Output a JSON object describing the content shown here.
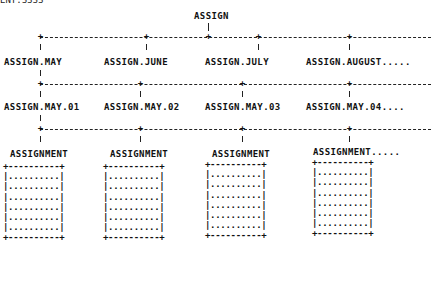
{
  "header_clip": "ENT.SSSS",
  "root": {
    "label": "ASSIGN"
  },
  "level1": [
    {
      "label": "ASSIGN.MAY"
    },
    {
      "label": "ASSIGN.JUNE"
    },
    {
      "label": "ASSIGN.JULY"
    },
    {
      "label": "ASSIGN.AUGUST....."
    }
  ],
  "level2": [
    {
      "label": "ASSIGN.MAY.01"
    },
    {
      "label": "ASSIGN.MAY.02"
    },
    {
      "label": "ASSIGN.MAY.03"
    },
    {
      "label": "ASSIGN.MAY.04...."
    }
  ],
  "level3": [
    {
      "label": "ASSIGNMENT"
    },
    {
      "label": "ASSIGNMENT"
    },
    {
      "label": "ASSIGNMENT"
    },
    {
      "label": "ASSIGNMENT....."
    }
  ],
  "record_box": {
    "top": "+----------+",
    "row": "|..........|",
    "bottom": "+----------+",
    "row_count": 6
  }
}
